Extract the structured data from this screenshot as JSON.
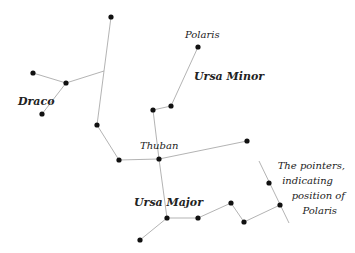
{
  "labels": {
    "draco": "Draco",
    "polaris": "Polaris",
    "ursa_minor": "Ursa Minor",
    "thuban": "Thuban",
    "ursa_major": "Ursa Major",
    "note_line1": "The pointers,",
    "note_line2": "indicating",
    "note_line3": "position of",
    "note_line4": "Polaris"
  },
  "colors": {
    "background": "#ffffff",
    "star": "#111111",
    "line": "#aaaaaa",
    "text": "#222222"
  },
  "stars": {
    "draco": [
      [
        111,
        17
      ],
      [
        33,
        73
      ],
      [
        66,
        83
      ],
      [
        42,
        114
      ],
      [
        97,
        125
      ],
      [
        119,
        160
      ],
      [
        159,
        159
      ],
      [
        247,
        141
      ]
    ],
    "ursa_minor": [
      [
        198,
        47
      ],
      [
        171,
        106
      ],
      [
        153,
        110
      ]
    ],
    "ursa_major": [
      [
        140,
        240
      ],
      [
        167,
        218
      ],
      [
        198,
        218
      ],
      [
        231,
        203
      ],
      [
        244,
        222
      ],
      [
        280,
        205
      ],
      [
        269,
        183
      ]
    ]
  }
}
